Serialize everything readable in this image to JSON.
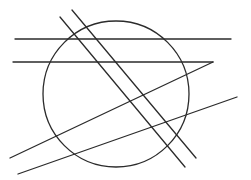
{
  "canvas": {
    "width": 251,
    "height": 180,
    "background": "#ffffff"
  },
  "style": {
    "stroke": "#2b2b2b",
    "stroke_width": 1.3
  },
  "diagram": {
    "circle": {
      "cx": 116,
      "cy": 94,
      "r": 73
    },
    "lines": [
      {
        "id": "horizontal-top",
        "x1": 15,
        "y1": 39,
        "x2": 231,
        "y2": 39
      },
      {
        "id": "horizontal-middle",
        "x1": 13,
        "y1": 62,
        "x2": 213,
        "y2": 62
      },
      {
        "id": "diagonal-shallow-upper",
        "x1": 10,
        "y1": 158,
        "x2": 213,
        "y2": 62
      },
      {
        "id": "diagonal-shallow-lower",
        "x1": 18,
        "y1": 174,
        "x2": 237,
        "y2": 97
      },
      {
        "id": "diagonal-steep-left",
        "x1": 60,
        "y1": 17,
        "x2": 185,
        "y2": 167
      },
      {
        "id": "diagonal-steep-right",
        "x1": 72,
        "y1": 10,
        "x2": 196,
        "y2": 158
      }
    ]
  }
}
